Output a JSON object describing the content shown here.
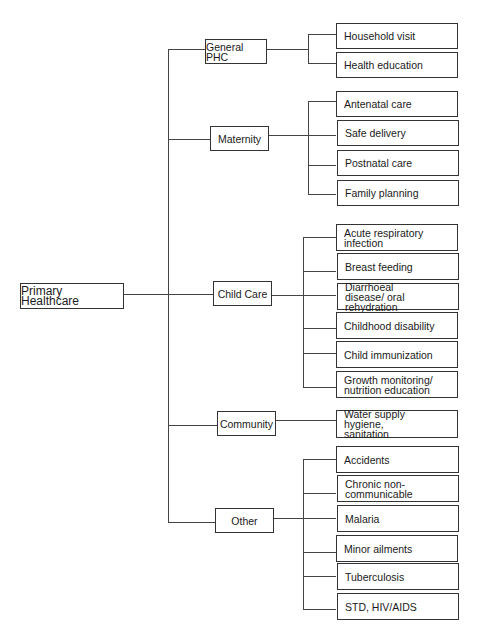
{
  "diagram": {
    "root": "Primary Healthcare",
    "categories": [
      {
        "label": "General PHC",
        "items": [
          "Household visit",
          "Health education"
        ]
      },
      {
        "label": "Maternity",
        "items": [
          "Antenatal care",
          "Safe delivery",
          "Postnatal care",
          "Family planning"
        ]
      },
      {
        "label": "Child Care",
        "items": [
          "Acute respiratory infection",
          "Breast feeding",
          "Diarrhoeal disease/ oral rehydration",
          "Childhood disability",
          "Child immunization",
          "Growth monitoring/ nutrition education"
        ]
      },
      {
        "label": "Community",
        "items": [
          "Water supply hygiene, sanitation"
        ]
      },
      {
        "label": "Other",
        "items": [
          "Accidents",
          "Chronic non-communicable",
          "Malaria",
          "Minor ailments",
          "Tuberculosis",
          "STD, HIV/AIDS"
        ]
      }
    ]
  }
}
